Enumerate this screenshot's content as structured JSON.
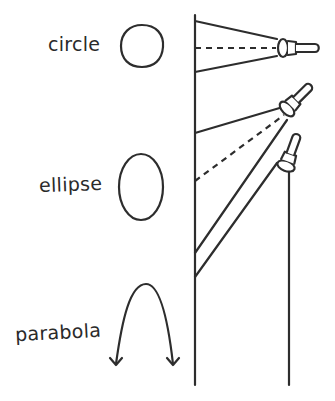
{
  "labels": {
    "circle": "circle",
    "ellipse": "ellipse",
    "parabola": "parabola"
  },
  "diagram": {
    "shapes": [
      {
        "name": "circle",
        "beam": "perpendicular to wall"
      },
      {
        "name": "ellipse",
        "beam": "tilted toward wall"
      },
      {
        "name": "parabola",
        "beam": "edge parallel to wall"
      }
    ]
  },
  "colors": {
    "ink": "#2d2d2d",
    "background": "#ffffff"
  }
}
